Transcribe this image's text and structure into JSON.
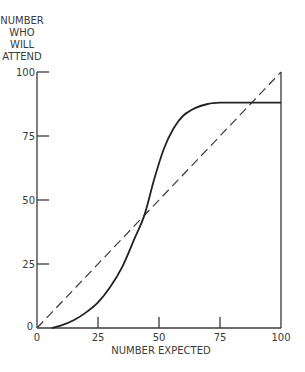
{
  "chart_data": {
    "type": "line",
    "title": "",
    "xlabel": "NUMBER EXPECTED",
    "ylabel_lines": [
      "NUMBER",
      "WHO",
      "WILL",
      "ATTEND"
    ],
    "xlim": [
      0,
      100
    ],
    "ylim": [
      0,
      100
    ],
    "x_ticks": [
      "0",
      "25",
      "50",
      "75",
      "100"
    ],
    "y_ticks": [
      "0",
      "25",
      "50",
      "75",
      "100"
    ],
    "grid": false,
    "legend": "none",
    "series": [
      {
        "name": "attendance curve",
        "style": "solid",
        "x": [
          6,
          10,
          15,
          20,
          25,
          30,
          35,
          40,
          44,
          48,
          52,
          56,
          60,
          65,
          70,
          75,
          80,
          90,
          100
        ],
        "y": [
          0,
          1,
          3,
          6,
          10,
          16,
          24,
          35,
          44,
          58,
          70,
          78,
          83,
          86,
          87.5,
          88,
          88,
          88,
          88
        ]
      },
      {
        "name": "45-degree line",
        "style": "dashed",
        "x": [
          0,
          100
        ],
        "y": [
          0,
          100
        ]
      }
    ],
    "annotations": [
      "intersection near (44, 44)"
    ]
  }
}
